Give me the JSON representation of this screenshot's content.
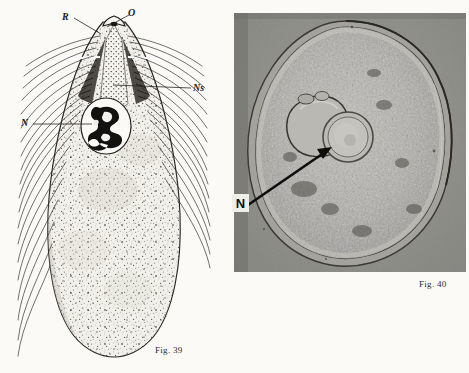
{
  "plate": {
    "description": "Two-panel scientific plate: left is a stippled line drawing of an elongate ciliate protozoan in longitudinal view; right is a grayscale photomicrograph of a rounded cell in optical section.",
    "background_color": "#fbfaf7"
  },
  "figures": [
    {
      "id": "fig39",
      "caption": "Fig. 39",
      "type": "line-drawing",
      "subject": "elongate ciliate protozoan, whole organism, apical end upward",
      "ink_color": "#1b1b1b",
      "body_fill": "#f1efe9",
      "labels": [
        {
          "key": "R",
          "text": "R",
          "meaning": "rostrum",
          "leader_from": [
            74,
            18
          ],
          "leader_to": [
            101,
            34
          ]
        },
        {
          "key": "O",
          "text": "O",
          "meaning": "oral opening",
          "leader_from": [
            129,
            15
          ],
          "leader_to": [
            106,
            27
          ]
        },
        {
          "key": "Ns",
          "text": "Ns",
          "meaning": "nuclear strand / stippled axial channel",
          "leader_from": [
            191,
            89
          ],
          "leader_to": [
            113,
            84
          ]
        },
        {
          "key": "N",
          "text": "N",
          "meaning": "nucleus",
          "leader_from": [
            33,
            124
          ],
          "leader_to": [
            92,
            124
          ]
        }
      ]
    },
    {
      "id": "fig40",
      "caption": "Fig. 40",
      "type": "photomicrograph",
      "subject": "rounded cell in optical section with granular cytoplasm, large clear vacuole and central nucleus",
      "frame": {
        "x": 234,
        "y": 13,
        "width": 232,
        "height": 259
      },
      "background_tone": "#8e8e8a",
      "labels": [
        {
          "key": "N",
          "text": "N",
          "meaning": "nucleus",
          "style": "white-box-bold-sans",
          "arrow_from": [
            250,
            203
          ],
          "arrow_to": [
            330,
            148
          ]
        }
      ]
    }
  ],
  "colors": {
    "page": "#fbfaf7",
    "ink": "#1b1b1b",
    "photo_mount": "#8e8e8a",
    "label_box": "#efefea"
  }
}
